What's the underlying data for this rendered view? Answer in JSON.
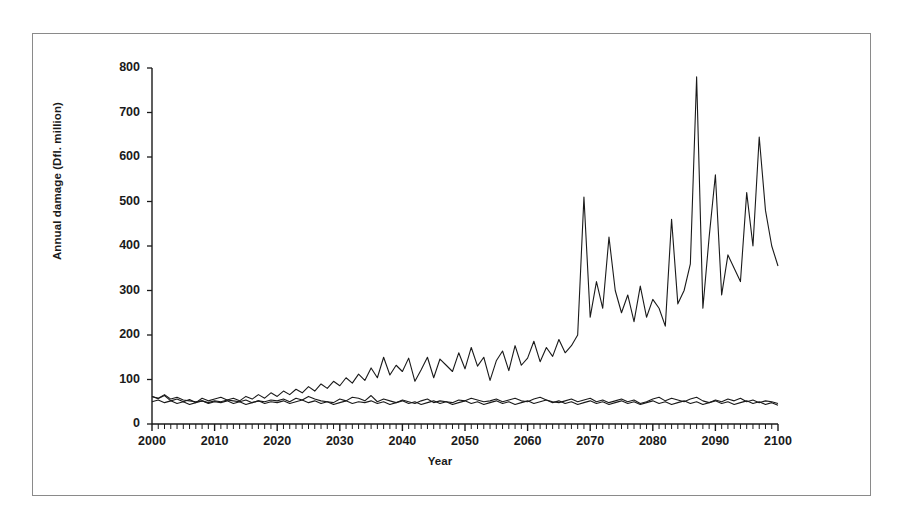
{
  "chart_data": {
    "type": "line",
    "title": "",
    "xlabel": "Year",
    "ylabel": "Annual damage (Dfl. million)",
    "xlim": [
      2000,
      2100
    ],
    "ylim": [
      0,
      800
    ],
    "grid": false,
    "legend": "none",
    "x_major_ticks": [
      2000,
      2010,
      2020,
      2030,
      2040,
      2050,
      2060,
      2070,
      2080,
      2090,
      2100
    ],
    "x_minor_tick_interval": 1,
    "y_ticks": [
      0,
      100,
      200,
      300,
      400,
      500,
      600,
      700,
      800
    ],
    "line_color": "#1a1a1a",
    "x": [
      2000,
      2001,
      2002,
      2003,
      2004,
      2005,
      2006,
      2007,
      2008,
      2009,
      2010,
      2011,
      2012,
      2013,
      2014,
      2015,
      2016,
      2017,
      2018,
      2019,
      2020,
      2021,
      2022,
      2023,
      2024,
      2025,
      2026,
      2027,
      2028,
      2029,
      2030,
      2031,
      2032,
      2033,
      2034,
      2035,
      2036,
      2037,
      2038,
      2039,
      2040,
      2041,
      2042,
      2043,
      2044,
      2045,
      2046,
      2047,
      2048,
      2049,
      2050,
      2051,
      2052,
      2053,
      2054,
      2055,
      2056,
      2057,
      2058,
      2059,
      2060,
      2061,
      2062,
      2063,
      2064,
      2065,
      2066,
      2067,
      2068,
      2069,
      2070,
      2071,
      2072,
      2073,
      2074,
      2075,
      2076,
      2077,
      2078,
      2079,
      2080,
      2081,
      2082,
      2083,
      2084,
      2085,
      2086,
      2087,
      2088,
      2089,
      2090,
      2091,
      2092,
      2093,
      2094,
      2095,
      2096,
      2097,
      2098,
      2099,
      2100
    ],
    "series": [
      {
        "name": "upper-scenario",
        "values": [
          62,
          57,
          64,
          52,
          56,
          50,
          55,
          48,
          58,
          52,
          56,
          60,
          54,
          58,
          52,
          62,
          56,
          66,
          58,
          70,
          62,
          74,
          66,
          78,
          70,
          84,
          74,
          90,
          80,
          96,
          86,
          104,
          92,
          112,
          98,
          126,
          104,
          150,
          110,
          132,
          118,
          148,
          96,
          122,
          150,
          104,
          146,
          132,
          118,
          160,
          124,
          172,
          130,
          150,
          98,
          142,
          164,
          120,
          176,
          132,
          148,
          186,
          140,
          172,
          152,
          190,
          160,
          176,
          200,
          510,
          240,
          320,
          260,
          420,
          300,
          250,
          290,
          230,
          310,
          240,
          280,
          260,
          220,
          460,
          270,
          300,
          360,
          780,
          260,
          420,
          560,
          290,
          380,
          350,
          320,
          520,
          400,
          645,
          480,
          400,
          355
        ]
      },
      {
        "name": "mid-scenario",
        "values": [
          62,
          58,
          66,
          56,
          60,
          54,
          52,
          50,
          52,
          48,
          52,
          50,
          54,
          52,
          50,
          54,
          48,
          52,
          50,
          54,
          52,
          56,
          50,
          58,
          54,
          62,
          56,
          52,
          50,
          48,
          56,
          52,
          60,
          58,
          52,
          64,
          50,
          56,
          52,
          48,
          54,
          50,
          46,
          52,
          56,
          48,
          52,
          50,
          48,
          54,
          52,
          58,
          54,
          50,
          52,
          56,
          50,
          54,
          58,
          52,
          50,
          56,
          60,
          54,
          50,
          48,
          52,
          56,
          50,
          54,
          58,
          50,
          54,
          48,
          52,
          56,
          50,
          54,
          46,
          50,
          56,
          60,
          52,
          58,
          54,
          50,
          56,
          60,
          52,
          48,
          54,
          50,
          56,
          52,
          58,
          50,
          54,
          48,
          52,
          50,
          46
        ]
      },
      {
        "name": "lower-scenario",
        "values": [
          50,
          54,
          48,
          52,
          46,
          50,
          44,
          48,
          52,
          46,
          50,
          48,
          52,
          46,
          50,
          44,
          48,
          52,
          46,
          50,
          48,
          52,
          46,
          50,
          54,
          48,
          52,
          46,
          50,
          44,
          48,
          52,
          46,
          50,
          48,
          52,
          46,
          50,
          44,
          48,
          52,
          46,
          50,
          44,
          48,
          52,
          46,
          50,
          44,
          48,
          52,
          46,
          50,
          44,
          48,
          52,
          46,
          50,
          44,
          48,
          52,
          46,
          50,
          54,
          48,
          52,
          46,
          50,
          44,
          48,
          52,
          46,
          50,
          44,
          48,
          52,
          46,
          50,
          44,
          48,
          52,
          46,
          50,
          44,
          48,
          52,
          46,
          50,
          44,
          48,
          52,
          46,
          50,
          44,
          48,
          52,
          46,
          50,
          44,
          48,
          42
        ]
      }
    ]
  }
}
